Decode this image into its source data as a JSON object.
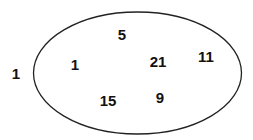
{
  "diagram": {
    "type": "single-set-venn",
    "set": {
      "stroke_color": "#222222",
      "regions": [
        {
          "id": "top",
          "value": "5"
        },
        {
          "id": "left",
          "value": "1"
        },
        {
          "id": "center",
          "value": "21"
        },
        {
          "id": "right",
          "value": "11"
        },
        {
          "id": "bottom-left",
          "value": "15"
        },
        {
          "id": "bottom-center",
          "value": "9"
        }
      ]
    },
    "outside": {
      "value": "1"
    }
  }
}
